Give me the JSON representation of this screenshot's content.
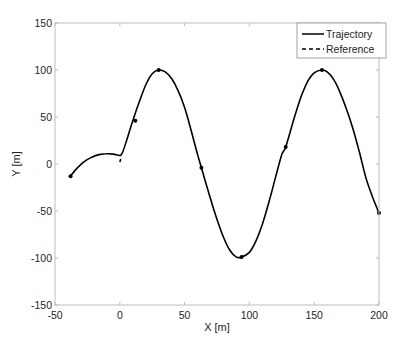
{
  "chart_data": {
    "type": "line",
    "title": "",
    "xlabel": "X [m]",
    "ylabel": "Y [m]",
    "xlim": [
      -50,
      200
    ],
    "ylim": [
      -150,
      150
    ],
    "xticks": [
      -50,
      0,
      50,
      100,
      150,
      200
    ],
    "yticks": [
      -150,
      -100,
      -50,
      0,
      50,
      100,
      150
    ],
    "grid": false,
    "legend": {
      "position": "upper right",
      "entries": [
        "Trajectory",
        "Reference"
      ]
    },
    "series": [
      {
        "name": "Trajectory",
        "style": "solid",
        "color": "#000000",
        "x": [
          -38,
          -34,
          -28,
          -22,
          -16,
          -10,
          -5,
          0,
          2,
          5,
          10,
          15,
          20,
          25,
          30,
          35,
          40,
          45,
          50,
          55,
          60,
          63,
          70,
          75,
          80,
          85,
          90,
          94,
          100,
          105,
          110,
          115,
          120,
          125,
          128,
          135,
          140,
          145,
          150,
          156,
          160,
          165,
          170,
          175,
          180,
          185,
          190,
          195,
          200
        ],
        "y": [
          -13,
          -6,
          2,
          7,
          10,
          11,
          10.5,
          9,
          12,
          24,
          46,
          66,
          84,
          96,
          100,
          98,
          91,
          78,
          60,
          36,
          10,
          -4,
          -37,
          -59,
          -78,
          -92,
          -99,
          -99,
          -94,
          -82,
          -64,
          -41,
          -15,
          10,
          18,
          51,
          72,
          88,
          97,
          100,
          98,
          90,
          76,
          58,
          37,
          12,
          -15,
          -35,
          -52
        ]
      },
      {
        "name": "Reference",
        "style": "dashed",
        "color": "#000000",
        "x": [
          0,
          0.5,
          1
        ],
        "y": [
          2,
          4,
          6
        ]
      }
    ],
    "markers": [
      {
        "x": -38,
        "y": -13
      },
      {
        "x": 12,
        "y": 46
      },
      {
        "x": 30,
        "y": 100
      },
      {
        "x": 63,
        "y": -4
      },
      {
        "x": 94,
        "y": -99
      },
      {
        "x": 128,
        "y": 18
      },
      {
        "x": 156,
        "y": 100
      },
      {
        "x": 200,
        "y": -52
      }
    ]
  }
}
